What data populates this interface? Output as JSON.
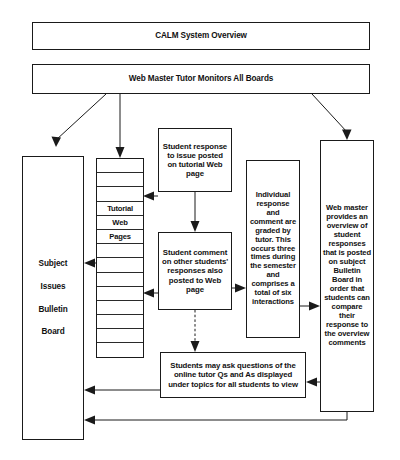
{
  "diagram": {
    "title": "CALM System Overview",
    "webmaster_banner": "Web Master Tutor Monitors All Boards",
    "nodes": {
      "subject_board": {
        "lines": [
          "Subject",
          "Issues",
          "Bulletin",
          "Board"
        ]
      },
      "tutorial_stack": {
        "labels": [
          "Tutorial",
          "Web",
          "Pages"
        ],
        "stripe_count": 14
      },
      "student_response": "Student response to issue posted on tutorial Web page",
      "student_comment": "Student comment on other students' responses also posted to Web page",
      "graded_by_tutor": "Individual response and comment are graded by tutor. This occurs three times during the semester and comprises a total of six interactions",
      "web_master_overview": "Web master provides an overview of student responses that is posted on subject Bulletin Board in order that students can compare their response to the overview comments",
      "online_tutor_questions": "Students may ask questions of the online tutor Qs and As displayed under topics for all students to view"
    },
    "colors": {
      "stroke": "#1a1a1a",
      "background": "#ffffff",
      "text": "#111111"
    }
  }
}
